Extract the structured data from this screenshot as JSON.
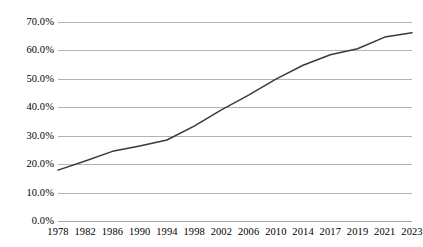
{
  "chart_data": {
    "type": "line",
    "title": "",
    "xlabel": "",
    "ylabel": "",
    "categories": [
      "1978",
      "1982",
      "1986",
      "1990",
      "1994",
      "1998",
      "2002",
      "2006",
      "2010",
      "2014",
      "2017",
      "2019",
      "2021",
      "2023"
    ],
    "values": [
      17.9,
      21.1,
      24.5,
      26.4,
      28.5,
      33.4,
      39.1,
      44.3,
      49.9,
      54.8,
      58.5,
      60.6,
      64.7,
      66.2
    ],
    "series": [
      {
        "name": "urbanization-rate",
        "values": [
          17.9,
          21.1,
          24.5,
          26.4,
          28.5,
          33.4,
          39.1,
          44.3,
          49.9,
          54.8,
          58.5,
          60.6,
          64.7,
          66.2
        ]
      }
    ],
    "y_ticks": [
      "0.0%",
      "10.0%",
      "20.0%",
      "30.0%",
      "40.0%",
      "50.0%",
      "60.0%",
      "70.0%"
    ],
    "y_tick_values": [
      0,
      10,
      20,
      30,
      40,
      50,
      60,
      70
    ],
    "ylim": [
      0,
      70
    ],
    "grid": true,
    "legend": false,
    "legend_position": "none",
    "series_color": "#3a3a3a",
    "gridline_color": "#b3b3b3",
    "background_color": "#ffffff",
    "text_color": "#000000"
  }
}
